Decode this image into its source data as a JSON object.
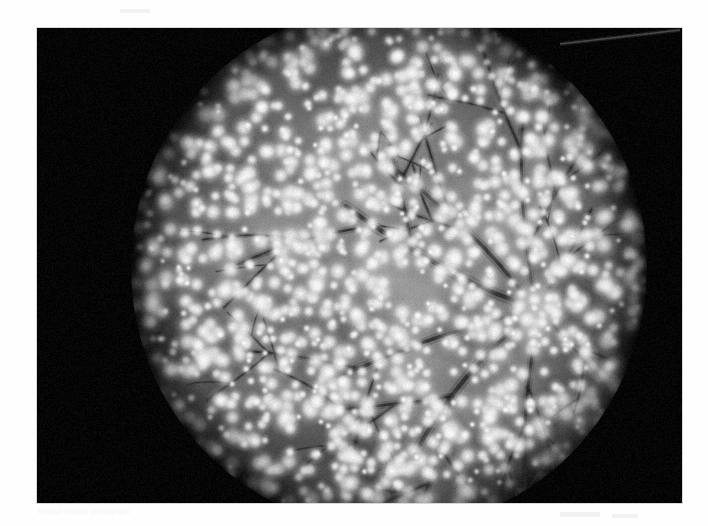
{
  "page": {
    "width": 708,
    "height": 526,
    "background_color": "#fefefe",
    "kind": "scanned-photograph-plate",
    "title": "Retinal fundus photograph"
  },
  "photo": {
    "name": "fundus-photograph",
    "x": 37,
    "y": 28,
    "width": 645,
    "height": 475,
    "background_color": "#050505",
    "modality": "monochrome fundus photograph",
    "description": "Grayscale retinal fundus photograph showing a circular illuminated retina on a black background, with the optic disc right of centre, branching retinal vessels radiating from it, and dense scattered bright punctate lesions across the whole fundus."
  },
  "fundus": {
    "name": "fundus-circle",
    "center_x": 352,
    "center_y": 240,
    "radius_x": 258,
    "radius_y": 262,
    "base_gray": "#8e8e8e",
    "rim_gray": "#0a0a0a",
    "edge_softness": 0.2,
    "vignette_start": 0.62
  },
  "optic_disc": {
    "name": "optic-disc",
    "center_x": 500,
    "center_y": 282,
    "radius_x": 26,
    "radius_y": 30,
    "gray": "#c6c6c6",
    "cup_gray": "#d2d2d2",
    "label": "optic disc"
  },
  "macula": {
    "name": "macula-region",
    "center_x": 300,
    "center_y": 300,
    "radius_x": 82,
    "radius_y": 66,
    "gray": "#6a6a6a",
    "label": "macula / posterior pole"
  },
  "lesions": {
    "name": "punctate-lesions",
    "label": "scattered bright punctate spots",
    "count": 1450,
    "color": "#f4f4f4",
    "radius_min": 2.0,
    "radius_max": 7.0,
    "density_falloff": 0.55,
    "glow_factor": 2.3,
    "seed": 20250411
  },
  "vessels": {
    "name": "retinal-vessels",
    "color": "#3a3a3a",
    "label": "retinal vessel tree",
    "origin_x": 500,
    "origin_y": 282,
    "trunks": [
      {
        "id": "superotemporal-arcade",
        "angle_deg": 200,
        "length": 230,
        "width": 4.4,
        "curve": 0.3,
        "branch_depth": 3
      },
      {
        "id": "superonasal-branch",
        "angle_deg": 232,
        "length": 210,
        "width": 3.6,
        "curve": -0.26,
        "branch_depth": 3
      },
      {
        "id": "superior-radial",
        "angle_deg": 258,
        "length": 200,
        "width": 3.0,
        "curve": 0.18,
        "branch_depth": 3
      },
      {
        "id": "nasal-superior-small",
        "angle_deg": 300,
        "length": 120,
        "width": 2.2,
        "curve": -0.2,
        "branch_depth": 2
      },
      {
        "id": "nasal-inferior-small",
        "angle_deg": 40,
        "length": 115,
        "width": 2.1,
        "curve": 0.22,
        "branch_depth": 2
      },
      {
        "id": "inferior-radial",
        "angle_deg": 96,
        "length": 195,
        "width": 3.0,
        "curve": -0.2,
        "branch_depth": 3
      },
      {
        "id": "inferotemporal-arcade",
        "angle_deg": 146,
        "length": 245,
        "width": 4.2,
        "curve": -0.32,
        "branch_depth": 3
      },
      {
        "id": "inferonasal-branch",
        "angle_deg": 170,
        "length": 235,
        "width": 3.4,
        "curve": -0.14,
        "branch_depth": 3
      }
    ],
    "seed": 77341
  },
  "artifacts": {
    "name": "film-artifacts",
    "top_right_streak": {
      "name": "light-streak",
      "x1": 560,
      "y1": 44,
      "x2": 680,
      "y2": 30,
      "color": "#5a5a5a",
      "width": 1.6
    },
    "grain_amount": 13,
    "grain_seed": 991
  }
}
